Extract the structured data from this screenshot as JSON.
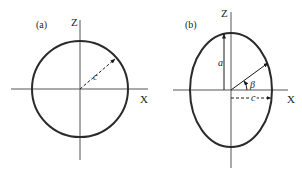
{
  "figure": {
    "panels": [
      {
        "id": "a",
        "label": "(a)",
        "shape": "circle",
        "center": [
          80,
          89
        ],
        "rx": 48,
        "rz": 48,
        "axes": {
          "x_label": "X",
          "z_label": "Z"
        },
        "annotations": [
          {
            "symbol": "c",
            "meaning": "radius",
            "style": "dashed-arrow",
            "angle_deg": 40
          }
        ]
      },
      {
        "id": "b",
        "label": "(b)",
        "shape": "ellipse",
        "center": [
          231,
          90
        ],
        "rx": 41,
        "rz": 57,
        "axes": {
          "x_label": "X",
          "z_label": "Z"
        },
        "annotations": [
          {
            "symbol": "a",
            "meaning": "semi-axis along Z",
            "style": "arrow"
          },
          {
            "symbol": "c",
            "meaning": "semi-axis along X",
            "style": "dashed-arrow"
          },
          {
            "symbol": "β",
            "meaning": "angle from X axis",
            "style": "arc-arrow"
          }
        ]
      }
    ],
    "stroke_color": "#2a2a2a",
    "axis_color": "#555555"
  }
}
